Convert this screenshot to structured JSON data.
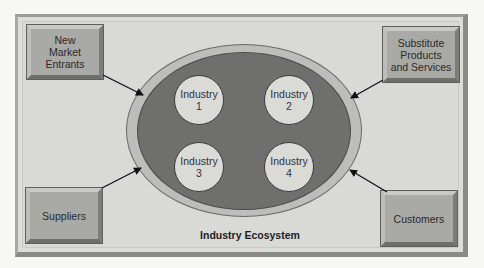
{
  "diagram": {
    "title": "Industry Ecosystem",
    "external_forces": [
      {
        "id": "new-market-entrants",
        "label": "New\nMarket\nEntrants",
        "position": "top-left"
      },
      {
        "id": "substitute-products",
        "label": "Substitute\nProducts\nand Services",
        "position": "top-right"
      },
      {
        "id": "suppliers",
        "label": "Suppliers",
        "position": "bottom-left"
      },
      {
        "id": "customers",
        "label": "Customers",
        "position": "bottom-right"
      }
    ],
    "industries": [
      {
        "label": "Industry\n1"
      },
      {
        "label": "Industry\n2"
      },
      {
        "label": "Industry\n3"
      },
      {
        "label": "Industry\n4"
      }
    ],
    "edges": [
      {
        "from": "New Market Entrants",
        "to": "Industry Ecosystem"
      },
      {
        "from": "Substitute Products and Services",
        "to": "Industry Ecosystem"
      },
      {
        "from": "Suppliers",
        "to": "Industry Ecosystem"
      },
      {
        "from": "Customers",
        "to": "Industry Ecosystem"
      }
    ],
    "colors": {
      "panel": "#dcdcd9",
      "box": "#a9a9a6",
      "ellipse_ring": "#bdbdba",
      "ellipse_fill": "#6f6f6d",
      "circle": "#dadad7"
    }
  }
}
